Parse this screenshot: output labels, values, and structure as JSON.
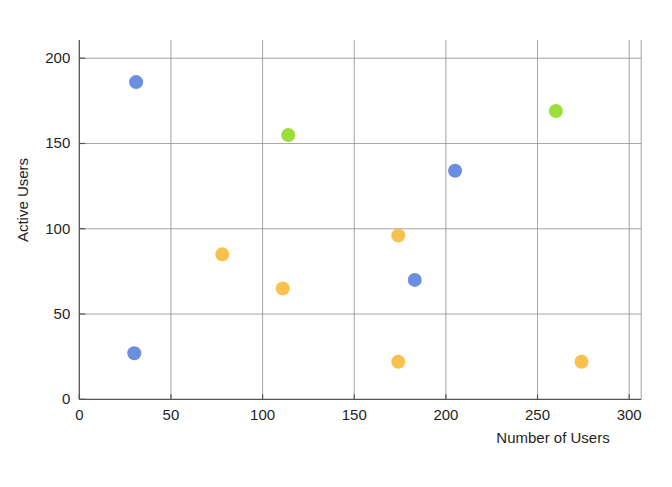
{
  "chart_data": {
    "type": "scatter",
    "title": "",
    "subtitle": "",
    "xlabel": "Number of Users",
    "ylabel": "Active Users",
    "xlim": [
      0,
      300
    ],
    "ylim": [
      0,
      200
    ],
    "xticks": [
      0,
      50,
      100,
      150,
      200,
      250,
      300
    ],
    "yticks": [
      0,
      50,
      100,
      150,
      200
    ],
    "xtick_labels": [
      "0",
      "50",
      "100",
      "150",
      "200",
      "250",
      "300"
    ],
    "ytick_labels": [
      "0",
      "50",
      "100",
      "150",
      "200"
    ],
    "grid": true,
    "legend": false,
    "legend_position": "none",
    "marker_size": 11,
    "colors": {
      "blue": "#6b8fe0",
      "orange": "#f8c04c",
      "green": "#9ede3a",
      "gridline": "#8a8a8a",
      "axis": "#555555",
      "text": "#1f1f1f",
      "background": "#ffffff"
    },
    "series": [
      {
        "name": "blue",
        "color": "#6b8fe0",
        "points": [
          {
            "x": 31,
            "y": 186
          },
          {
            "x": 30,
            "y": 27
          },
          {
            "x": 183,
            "y": 70
          },
          {
            "x": 205,
            "y": 134
          }
        ]
      },
      {
        "name": "orange",
        "color": "#f8c04c",
        "points": [
          {
            "x": 78,
            "y": 85
          },
          {
            "x": 111,
            "y": 65
          },
          {
            "x": 174,
            "y": 96
          },
          {
            "x": 174,
            "y": 22
          },
          {
            "x": 274,
            "y": 22
          }
        ]
      },
      {
        "name": "green",
        "color": "#9ede3a",
        "points": [
          {
            "x": 114,
            "y": 155
          },
          {
            "x": 260,
            "y": 169
          }
        ]
      }
    ]
  },
  "figure": {
    "name": "scatter-plot",
    "x_axis_title": "Number of Users",
    "y_axis_title": "Active Users"
  }
}
